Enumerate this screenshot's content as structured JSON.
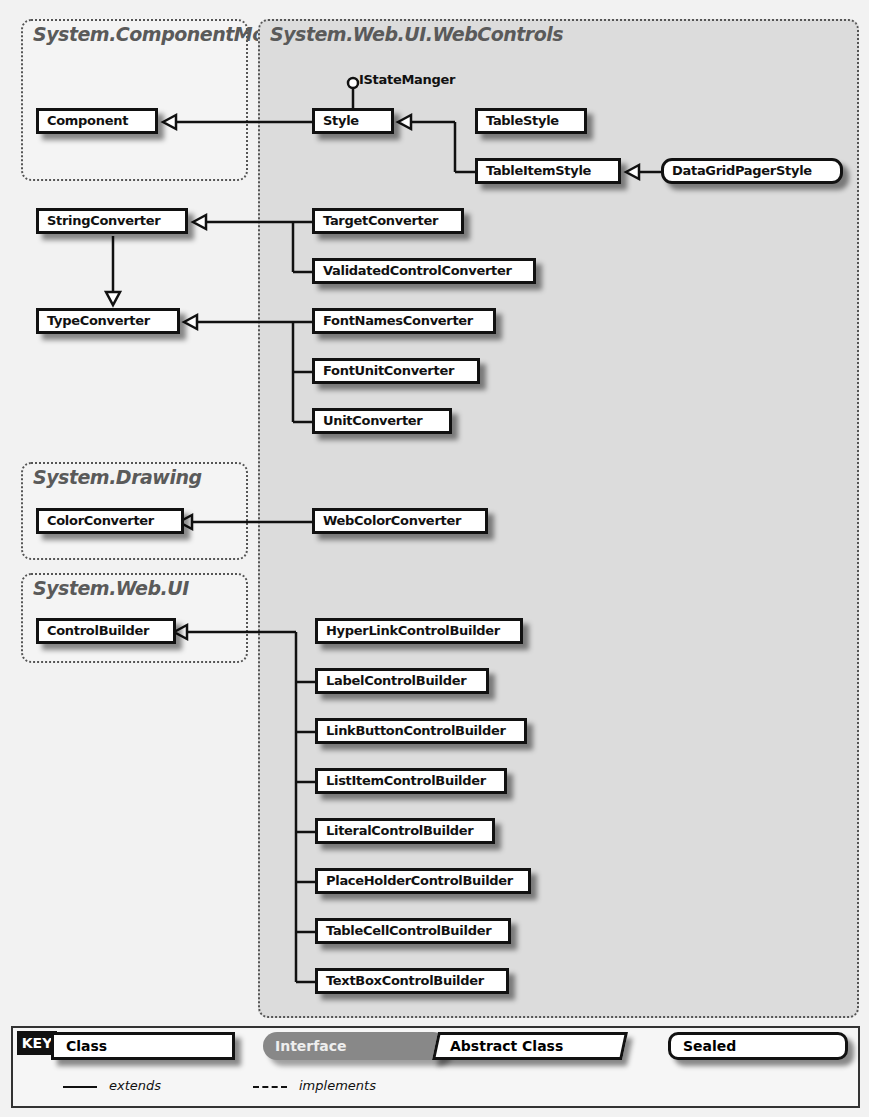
{
  "packages": {
    "component_model": "System.ComponentModel",
    "web_controls": "System.Web.UI.WebControls",
    "drawing": "System.Drawing",
    "web_ui": "System.Web.UI"
  },
  "interface_label": "IStateManger",
  "classes": {
    "component": "Component",
    "string_converter": "StringConverter",
    "type_converter": "TypeConverter",
    "color_converter": "ColorConverter",
    "control_builder": "ControlBuilder",
    "style": "Style",
    "table_style": "TableStyle",
    "table_item_style": "TableItemStyle",
    "data_grid_pager_style": "DataGridPagerStyle",
    "target_converter": "TargetConverter",
    "validated_control_converter": "ValidatedControlConverter",
    "font_names_converter": "FontNamesConverter",
    "font_unit_converter": "FontUnitConverter",
    "unit_converter": "UnitConverter",
    "web_color_converter": "WebColorConverter",
    "builders": [
      "HyperLinkControlBuilder",
      "LabelControlBuilder",
      "LinkButtonControlBuilder",
      "ListItemControlBuilder",
      "LiteralControlBuilder",
      "PlaceHolderControlBuilder",
      "TableCellControlBuilder",
      "TextBoxControlBuilder"
    ]
  },
  "key": {
    "title": "KEY",
    "class": "Class",
    "interface": "Interface",
    "abstract_class": "Abstract Class",
    "sealed": "Sealed",
    "extends": "extends",
    "implements": "implements"
  }
}
